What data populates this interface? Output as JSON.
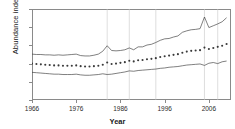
{
  "chart_data": {
    "type": "line",
    "title": "",
    "xlabel": "Year",
    "ylabel": "Abundance index",
    "xlim": [
      1966,
      2011
    ],
    "ylim": [
      0,
      25
    ],
    "xticks": [
      1966,
      1976,
      1986,
      1996,
      2006
    ],
    "yticks": [
      0,
      5,
      10,
      15,
      20,
      25
    ],
    "grid": "vertical reference lines only",
    "legend": "none",
    "vertical_reference_lines": [
      1983,
      1988,
      1994,
      2005,
      2008
    ],
    "x": [
      1966,
      1967,
      1968,
      1969,
      1970,
      1971,
      1972,
      1973,
      1974,
      1975,
      1976,
      1977,
      1978,
      1979,
      1980,
      1981,
      1982,
      1983,
      1984,
      1985,
      1986,
      1987,
      1988,
      1989,
      1990,
      1991,
      1992,
      1993,
      1994,
      1995,
      1996,
      1997,
      1998,
      1999,
      2000,
      2001,
      2002,
      2003,
      2004,
      2005,
      2006,
      2007,
      2008,
      2009,
      2010
    ],
    "series": [
      {
        "name": "Upper confidence limit",
        "style": "solid-line",
        "values": [
          12.6,
          12.5,
          12.5,
          12.4,
          12.4,
          12.3,
          12.4,
          12.3,
          12.4,
          12.5,
          12.6,
          12.2,
          12.1,
          12.1,
          12.3,
          12.6,
          13.4,
          14.9,
          13.6,
          13.5,
          13.6,
          13.8,
          14.3,
          13.8,
          14.6,
          14.6,
          15.1,
          15.3,
          15.8,
          16.4,
          16.8,
          16.9,
          17.3,
          17.6,
          18.6,
          19.0,
          19.3,
          19.4,
          19.6,
          22.8,
          19.9,
          20.4,
          20.9,
          21.5,
          22.6
        ]
      },
      {
        "name": "Mean abundance index",
        "style": "dotted-markers",
        "values": [
          10.0,
          9.9,
          9.8,
          9.7,
          9.6,
          9.5,
          9.5,
          9.4,
          9.4,
          9.4,
          9.5,
          9.3,
          9.2,
          9.2,
          9.3,
          9.4,
          9.7,
          10.3,
          9.9,
          10.0,
          10.2,
          10.4,
          10.8,
          10.6,
          10.9,
          11.0,
          11.2,
          11.3,
          11.5,
          11.8,
          12.0,
          12.2,
          12.4,
          12.6,
          13.0,
          13.3,
          13.5,
          13.6,
          13.7,
          14.4,
          14.0,
          14.3,
          14.6,
          14.9,
          15.4
        ]
      },
      {
        "name": "Lower confidence limit",
        "style": "solid-line",
        "values": [
          7.6,
          7.5,
          7.4,
          7.3,
          7.2,
          7.1,
          7.1,
          7.0,
          7.0,
          7.0,
          7.1,
          6.9,
          6.8,
          6.8,
          6.9,
          7.0,
          7.2,
          7.0,
          7.1,
          7.3,
          7.5,
          7.7,
          8.0,
          7.9,
          8.1,
          8.2,
          8.3,
          8.4,
          8.5,
          8.7,
          8.8,
          9.0,
          9.1,
          9.2,
          9.4,
          9.6,
          9.7,
          9.8,
          9.9,
          9.5,
          10.1,
          10.3,
          10.0,
          10.5,
          10.7
        ]
      }
    ]
  },
  "axes": {
    "y_title": "Abundance index",
    "x_title": "Year",
    "y_tick_labels": [
      "0",
      "5",
      "10",
      "15",
      "20",
      "25"
    ],
    "x_tick_labels": [
      "1966",
      "1976",
      "1986",
      "1996",
      "2006"
    ]
  },
  "colors": {
    "line": "#3a3a3a",
    "axis": "#8a8a8a",
    "gridline": "#c8c8c8",
    "background": "#ffffff",
    "text": "#1a1a1a"
  }
}
